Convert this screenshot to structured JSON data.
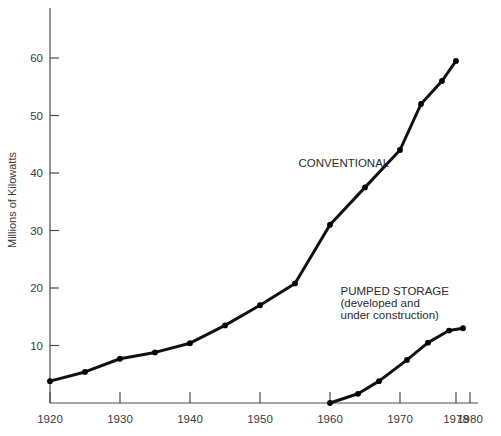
{
  "chart_data": {
    "type": "line",
    "title": "",
    "subtitle": "",
    "xlabel": "",
    "ylabel": "Millions of Kilowatts",
    "xlim": [
      1920,
      1980
    ],
    "ylim": [
      0,
      65
    ],
    "grid": false,
    "legend_position": "inline-annotation",
    "x_ticks": [
      1920,
      1930,
      1940,
      1950,
      1960,
      1970,
      1978,
      1980
    ],
    "x_tick_labels": [
      "1920",
      "1930",
      "1940",
      "1950",
      "1960",
      "1970",
      "1978",
      "1980"
    ],
    "y_ticks": [
      10,
      20,
      30,
      40,
      50,
      60
    ],
    "y_tick_labels": [
      "10",
      "20",
      "30",
      "40",
      "50",
      "60"
    ],
    "series": [
      {
        "name": "CONVENTIONAL",
        "marker": "dot",
        "x": [
          1920,
          1925,
          1930,
          1935,
          1940,
          1945,
          1950,
          1955,
          1960,
          1965,
          1970,
          1973,
          1976,
          1978
        ],
        "values": [
          3.8,
          5.4,
          7.7,
          8.8,
          10.4,
          13.5,
          17.0,
          20.8,
          31.0,
          37.5,
          44.0,
          52.0,
          56.0,
          59.5
        ]
      },
      {
        "name": "PUMPED STORAGE",
        "marker": "dot",
        "x": [
          1960,
          1964,
          1967,
          1971,
          1974,
          1977,
          1979
        ],
        "values": [
          0.0,
          1.6,
          3.8,
          7.5,
          10.5,
          12.6,
          13.0
        ]
      }
    ],
    "annotations": [
      {
        "text": "CONVENTIONAL",
        "x": 1955.5,
        "y": 41.0
      },
      {
        "text": "PUMPED STORAGE",
        "x": 1961.5,
        "y": 18.8
      },
      {
        "text": "(developed and",
        "x": 1961.5,
        "y": 16.7
      },
      {
        "text": "under construction)",
        "x": 1961.5,
        "y": 14.6
      }
    ]
  },
  "colors": {
    "line": "#111111",
    "axis": "#4a4a4a",
    "text": "#2b2b2b",
    "background": "#ffffff"
  }
}
